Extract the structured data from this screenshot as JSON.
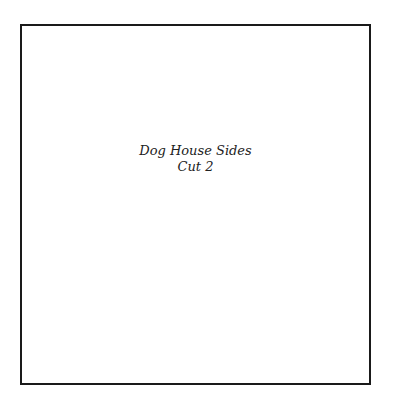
{
  "panel": {
    "title": "Dog House Sides",
    "subtitle": "Cut 2"
  },
  "colors": {
    "border": "#1a1a1a",
    "text": "#222222",
    "background": "#ffffff"
  }
}
